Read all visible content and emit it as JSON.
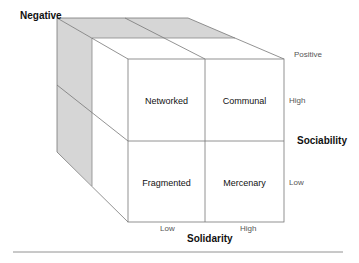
{
  "diagram": {
    "type": "3d-cube-quadrant-matrix",
    "axes": {
      "depth": {
        "label": "Negative",
        "end_label": "Positive"
      },
      "vertical": {
        "title": "Sociability",
        "high": "High",
        "low": "Low"
      },
      "horizontal": {
        "title": "Solidarity",
        "low": "Low",
        "high": "High"
      }
    },
    "cells": [
      {
        "label": "Networked",
        "sociability": "High",
        "solidarity": "Low"
      },
      {
        "label": "Communal",
        "sociability": "High",
        "solidarity": "High"
      },
      {
        "label": "Fragmented",
        "sociability": "Low",
        "solidarity": "Low"
      },
      {
        "label": "Mercenary",
        "sociability": "Low",
        "solidarity": "High"
      }
    ],
    "colors": {
      "shade": "#d4d4d4",
      "line": "#777777",
      "text": "#111111"
    }
  }
}
